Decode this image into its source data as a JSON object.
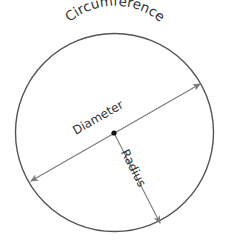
{
  "diagram": {
    "labels": {
      "circumference": "Circumference",
      "diameter": "Diameter",
      "radius": "Radius"
    },
    "circle": {
      "center": [
        114.5,
        132.5
      ],
      "radius": 99
    },
    "diameter_line": {
      "from": [
        31,
        181
      ],
      "to": [
        200,
        84
      ],
      "arrows": "both"
    },
    "radius_line": {
      "from": [
        114,
        133
      ],
      "to": [
        160,
        223
      ],
      "arrows": "end"
    },
    "center_point": [
      114,
      133
    ],
    "colors": {
      "circle_stroke": "#555555",
      "line_stroke": "#7a7a7a",
      "text": "#333333",
      "center_dot": "#111111",
      "background": "#ffffff"
    }
  }
}
